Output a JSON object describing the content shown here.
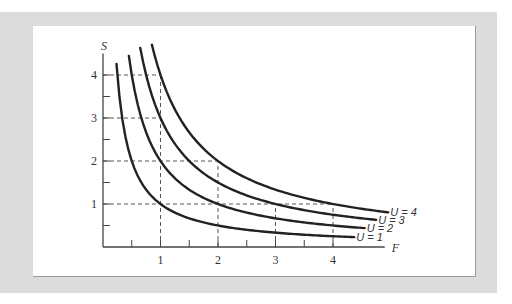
{
  "chart_data": {
    "type": "line",
    "title": "",
    "xlabel": "F",
    "ylabel": "S",
    "xlim": [
      0,
      5
    ],
    "ylim": [
      0,
      4.8
    ],
    "grid": false,
    "x_ticks": [
      1,
      2,
      3,
      4
    ],
    "x_minor_ticks": [
      0.5,
      1.5,
      2.5,
      3.5
    ],
    "y_ticks": [
      1,
      2,
      3,
      4
    ],
    "y_minor_ticks": [
      0.5,
      1.5,
      2.5,
      3.5
    ],
    "equation": "U = F * S",
    "series": [
      {
        "name": "U = 1",
        "label": "U = 1",
        "U": 1,
        "F_start": 0.235,
        "F_end": 4.37,
        "points": [
          [
            0.25,
            4
          ],
          [
            0.5,
            2
          ],
          [
            1,
            1
          ],
          [
            2,
            0.5
          ],
          [
            3,
            0.333
          ],
          [
            4,
            0.25
          ]
        ]
      },
      {
        "name": "U = 2",
        "label": "U = 2",
        "U": 2,
        "F_start": 0.45,
        "F_end": 4.55,
        "points": [
          [
            0.5,
            4
          ],
          [
            1,
            2
          ],
          [
            2,
            1
          ],
          [
            3,
            0.667
          ],
          [
            4,
            0.5
          ]
        ]
      },
      {
        "name": "U = 3",
        "label": "U = 3",
        "U": 3,
        "F_start": 0.648,
        "F_end": 4.75,
        "points": [
          [
            0.75,
            4
          ],
          [
            1,
            3
          ],
          [
            2,
            1.5
          ],
          [
            3,
            1
          ],
          [
            4,
            0.75
          ]
        ]
      },
      {
        "name": "U = 4",
        "label": "U = 4",
        "U": 4,
        "F_start": 0.85,
        "F_end": 4.96,
        "points": [
          [
            1,
            4
          ],
          [
            2,
            2
          ],
          [
            4,
            1
          ]
        ]
      }
    ],
    "reference_lines": {
      "vertical": [
        {
          "F": 1,
          "to_S": 4
        },
        {
          "F": 2,
          "to_S": 2
        },
        {
          "F": 3,
          "to_S": 1
        },
        {
          "F": 4,
          "to_S": 1
        }
      ],
      "horizontal": [
        {
          "S": 4,
          "to_F": 1
        },
        {
          "S": 3,
          "to_F": 1
        },
        {
          "S": 2,
          "to_F": 2
        },
        {
          "S": 1,
          "to_F": 4
        }
      ]
    },
    "layout": {
      "origin_px": [
        103,
        247
      ],
      "px_per_F": 57.5,
      "px_per_S": 43,
      "x_axis_end_F": 4.9,
      "y_axis_top_S": 4.5
    },
    "colors": {
      "curve": "#222222",
      "axis": "#444444",
      "dash": "#555555",
      "frame": "#dcdcdc",
      "panel": "#ffffff"
    }
  }
}
